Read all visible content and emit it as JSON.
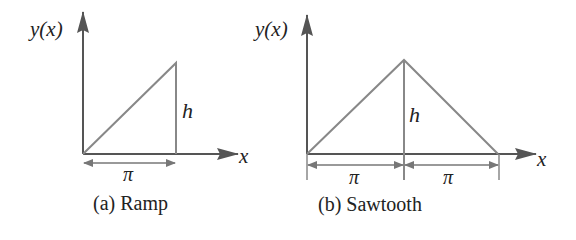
{
  "colors": {
    "axis": "#555555",
    "curve": "#888888",
    "text": "#222222"
  },
  "ramp": {
    "y_axis_label": "y(x)",
    "x_axis_label": "x",
    "height_label": "h",
    "width_label": "π",
    "caption": "(a) Ramp"
  },
  "sawtooth": {
    "y_axis_label": "y(x)",
    "x_axis_label": "x",
    "height_label": "h",
    "left_width_label": "π",
    "right_width_label": "π",
    "caption": "(b) Sawtooth"
  }
}
